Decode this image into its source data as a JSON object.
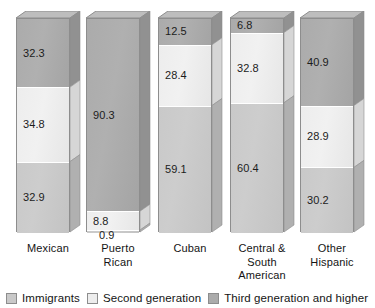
{
  "chart_data": {
    "type": "bar",
    "subtype": "stacked-bar-100-percent-3d",
    "title": "",
    "xlabel": "",
    "ylabel": "",
    "ylim": [
      0,
      100
    ],
    "grid": false,
    "legend_position": "bottom-left",
    "categories": [
      "Mexican",
      "Puerto Rican",
      "Cuban",
      "Central & South American",
      "Other Hispanic"
    ],
    "category_label_lines": [
      [
        "Mexican"
      ],
      [
        "Puerto",
        "Rican"
      ],
      [
        "Cuban"
      ],
      [
        "Central &",
        "South",
        "American"
      ],
      [
        "Other",
        "Hispanic"
      ]
    ],
    "series": [
      {
        "name": "Immigrants",
        "color": "#c9c9c9",
        "values": [
          32.9,
          0.9,
          59.1,
          60.4,
          30.2
        ]
      },
      {
        "name": "Second generation",
        "color": "#ededed",
        "values": [
          34.8,
          8.8,
          28.4,
          32.8,
          28.9
        ]
      },
      {
        "name": "Third generation and higher",
        "color": "#ababab",
        "values": [
          32.3,
          90.3,
          12.5,
          6.8,
          40.9
        ]
      }
    ],
    "stack_order_top_to_bottom": [
      "Third generation and higher",
      "Second generation",
      "Immigrants"
    ],
    "bars": [
      {
        "category": "Mexican",
        "segments": [
          {
            "series": "Third generation and higher",
            "value": 32.3,
            "label": "32.3"
          },
          {
            "series": "Second generation",
            "value": 34.8,
            "label": "34.8"
          },
          {
            "series": "Immigrants",
            "value": 32.9,
            "label": "32.9"
          }
        ]
      },
      {
        "category": "Puerto Rican",
        "segments": [
          {
            "series": "Third generation and higher",
            "value": 90.3,
            "label": "90.3"
          },
          {
            "series": "Second generation",
            "value": 8.8,
            "label": "8.8"
          },
          {
            "series": "Immigrants",
            "value": 0.9,
            "label": "0.9"
          }
        ]
      },
      {
        "category": "Cuban",
        "segments": [
          {
            "series": "Third generation and higher",
            "value": 12.5,
            "label": "12.5"
          },
          {
            "series": "Second generation",
            "value": 28.4,
            "label": "28.4"
          },
          {
            "series": "Immigrants",
            "value": 59.1,
            "label": "59.1"
          }
        ]
      },
      {
        "category": "Central & South American",
        "segments": [
          {
            "series": "Third generation and higher",
            "value": 6.8,
            "label": "6.8"
          },
          {
            "series": "Second generation",
            "value": 32.8,
            "label": "32.8"
          },
          {
            "series": "Immigrants",
            "value": 60.4,
            "label": "60.4"
          }
        ]
      },
      {
        "category": "Other Hispanic",
        "segments": [
          {
            "series": "Third generation and higher",
            "value": 40.9,
            "label": "40.9"
          },
          {
            "series": "Second generation",
            "value": 28.9,
            "label": "28.9"
          },
          {
            "series": "Immigrants",
            "value": 30.2,
            "label": "30.2"
          }
        ]
      }
    ]
  },
  "legend": {
    "items": [
      {
        "label": "Immigrants",
        "color": "#c9c9c9",
        "swatch_name": "legend-swatch-immigrants"
      },
      {
        "label": "Second generation",
        "color": "#ededed",
        "swatch_name": "legend-swatch-second-generation"
      },
      {
        "label": "Third generation and higher",
        "color": "#ababab",
        "swatch_name": "legend-swatch-third-generation"
      }
    ]
  }
}
